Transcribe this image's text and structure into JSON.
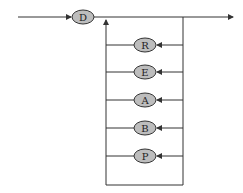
{
  "diagram": {
    "type": "railroad-syntax-diagram",
    "start_node": {
      "label": "D"
    },
    "loop_nodes": [
      {
        "label": "R"
      },
      {
        "label": "E"
      },
      {
        "label": "A"
      },
      {
        "label": "B"
      },
      {
        "label": "P"
      }
    ],
    "colors": {
      "line": "#333333",
      "node_fill": "#bdbdbd",
      "node_stroke": "#333333"
    }
  }
}
